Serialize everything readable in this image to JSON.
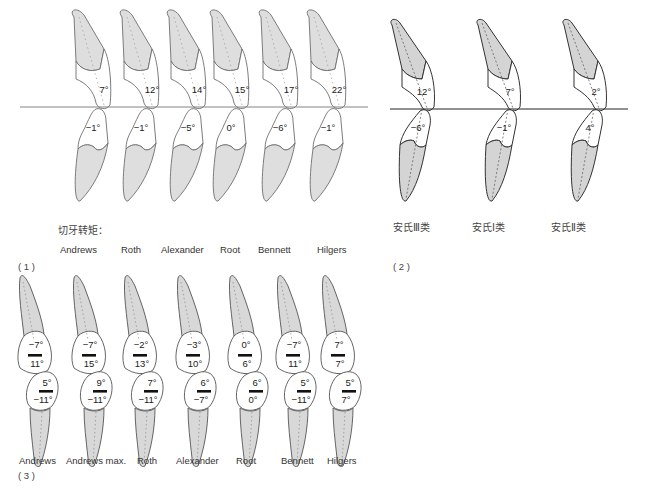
{
  "panel1": {
    "caption": "切牙转矩：",
    "panel_label": "( 1 )",
    "colors": {
      "fill": "#dedede",
      "stroke": "#6e6e6e",
      "line": "#777777"
    },
    "reference_line": {
      "x1": 20,
      "x2": 368,
      "y": 107
    },
    "systems": [
      {
        "name": "Andrews",
        "upper": "7°",
        "lower": "−1°",
        "cx": 98,
        "label_x": 60
      },
      {
        "name": "Roth",
        "upper": "12°",
        "lower": "−1°",
        "cx": 146,
        "label_x": 121
      },
      {
        "name": "Alexander",
        "upper": "14°",
        "lower": "−5°",
        "cx": 193,
        "label_x": 161
      },
      {
        "name": "Root",
        "upper": "15°",
        "lower": "0°",
        "cx": 236,
        "label_x": 220
      },
      {
        "name": "Bennett",
        "upper": "17°",
        "lower": "−6°",
        "cx": 285,
        "label_x": 258
      },
      {
        "name": "Hilgers",
        "upper": "22°",
        "lower": "−1°",
        "cx": 333,
        "label_x": 317
      }
    ]
  },
  "panel2": {
    "panel_label": "( 2 )",
    "colors": {
      "fill": "#d4d4d4",
      "stroke": "#333333",
      "line": "#222222"
    },
    "reference_line": {
      "x1": 390,
      "x2": 628,
      "y": 109
    },
    "classes": [
      {
        "name": "安氏Ⅲ类",
        "upper": "12°",
        "lower": "−6°",
        "cx": 432,
        "label_x": 393
      },
      {
        "name": "安氏Ⅰ类",
        "upper": "7°",
        "lower": "−1°",
        "cx": 518,
        "label_x": 472
      },
      {
        "name": "安氏Ⅱ类",
        "upper": "2°",
        "lower": "4°",
        "cx": 604,
        "label_x": 551
      }
    ]
  },
  "panel3": {
    "panel_label": "( 3 )",
    "colors": {
      "fill": "#d8d8d8",
      "stroke": "#555555"
    },
    "systems": [
      {
        "name": "Andrews",
        "upper_top": "−7°",
        "upper_bottom": "11°",
        "lower_top": "5°",
        "lower_bottom": "−11°",
        "cx": 38,
        "label_x": 19
      },
      {
        "name": "Andrews max.",
        "upper_top": "−7°",
        "upper_bottom": "15°",
        "lower_top": "9°",
        "lower_bottom": "−11°",
        "cx": 92,
        "label_x": 66
      },
      {
        "name": "Roth",
        "upper_top": "−2°",
        "upper_bottom": "13°",
        "lower_top": "7°",
        "lower_bottom": "−11°",
        "cx": 143,
        "label_x": 137
      },
      {
        "name": "Alexander",
        "upper_top": "−3°",
        "upper_bottom": "10°",
        "lower_top": "6°",
        "lower_bottom": "−7°",
        "cx": 196,
        "label_x": 176
      },
      {
        "name": "Root",
        "upper_top": "0°",
        "upper_bottom": "6°",
        "lower_top": "6°",
        "lower_bottom": "0°",
        "cx": 248,
        "label_x": 236
      },
      {
        "name": "Bennett",
        "upper_top": "−7°",
        "upper_bottom": "11°",
        "lower_top": "5°",
        "lower_bottom": "−11°",
        "cx": 296,
        "label_x": 281
      },
      {
        "name": "Hilgers",
        "upper_top": "7°",
        "upper_bottom": "7°",
        "lower_top": "5°",
        "lower_bottom": "7°",
        "cx": 341,
        "label_x": 327
      }
    ]
  }
}
